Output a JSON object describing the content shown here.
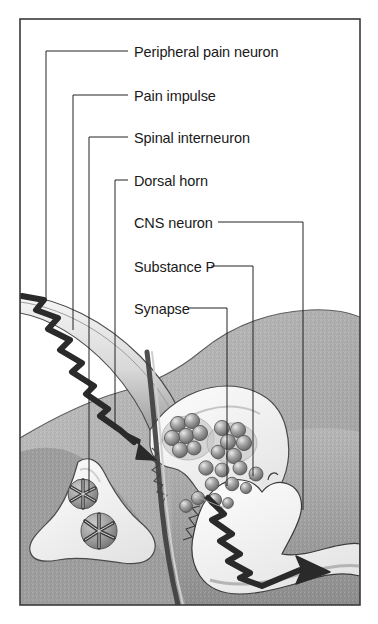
{
  "figure": {
    "frame_color": "#3a3a3a",
    "background_color": "#ffffff"
  },
  "labels": [
    {
      "id": "peripheral-pain-neuron",
      "text": "Peripheral pain neuron",
      "x": 134,
      "y": 57
    },
    {
      "id": "pain-impulse",
      "text": "Pain impulse",
      "x": 134,
      "y": 101
    },
    {
      "id": "spinal-interneuron",
      "text": "Spinal interneuron",
      "x": 134,
      "y": 143
    },
    {
      "id": "dorsal-horn",
      "text": "Dorsal horn",
      "x": 134,
      "y": 186
    },
    {
      "id": "cns-neuron",
      "text": "CNS neuron",
      "x": 134,
      "y": 228
    },
    {
      "id": "substance-p",
      "text": "Substance P",
      "x": 134,
      "y": 272
    },
    {
      "id": "synapse",
      "text": "Synapse",
      "x": 134,
      "y": 314
    }
  ],
  "colors": {
    "ink": "#1a1a1a",
    "leader": "#222222",
    "tissue_dark": "#8e8e8e",
    "tissue_mid": "#a9a9a9",
    "tissue_light": "#c9c9c9",
    "cell_fill": "#f3f3f3",
    "vesicle": "#8a8a8a",
    "membrane": "#6b6b6b"
  },
  "structures": [
    {
      "name": "peripheral-pain-neuron-axon",
      "description": "curved axon entering from upper left"
    },
    {
      "name": "pain-impulse-zigzag",
      "description": "lightning-bolt arrow travelling down the axon"
    },
    {
      "name": "presynaptic-terminal",
      "description": "axon terminal containing substance P vesicles"
    },
    {
      "name": "spinal-interneuron",
      "description": "triangular cell at lower left with two granular inclusions"
    },
    {
      "name": "dorsal-horn",
      "description": "shaded grey tissue field of the spinal cord dorsal horn"
    },
    {
      "name": "cns-neuron",
      "description": "postsynaptic CNS neuron at lower right with outgoing axon"
    },
    {
      "name": "substance-p-vesicles",
      "description": "clustered spherical neurotransmitter vesicles"
    },
    {
      "name": "synaptic-cleft",
      "description": "gap between presynaptic terminal and CNS neuron"
    },
    {
      "name": "outgoing-impulse-zigzag",
      "description": "lightning-bolt arrow exiting along CNS neuron axon"
    }
  ]
}
